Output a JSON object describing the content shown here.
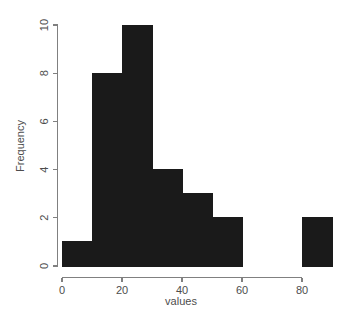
{
  "chart_data": {
    "type": "bar",
    "title": "",
    "xlabel": "values",
    "ylabel": "Frequency",
    "categories": [
      "0-10",
      "10-20",
      "20-30",
      "30-40",
      "40-50",
      "50-60",
      "60-70",
      "70-80",
      "80-90"
    ],
    "bin_edges": [
      0,
      10,
      20,
      30,
      40,
      50,
      60,
      70,
      80,
      90
    ],
    "bin_width": 10,
    "values": [
      1,
      8,
      10,
      4,
      3,
      2,
      0,
      0,
      2
    ],
    "x": [
      5,
      15,
      25,
      35,
      45,
      55,
      65,
      75,
      85
    ],
    "xlim": [
      0,
      90
    ],
    "ylim": [
      0,
      10
    ],
    "xticks": [
      0,
      20,
      40,
      60,
      80
    ],
    "xtick_labels": [
      "0",
      "20",
      "40",
      "60",
      "80"
    ],
    "yticks": [
      0,
      2,
      4,
      6,
      8,
      10
    ],
    "ytick_labels": [
      "0",
      "2",
      "4",
      "6",
      "8",
      "10"
    ],
    "grid": false,
    "legend": null,
    "bar_color": "#1a1a1a",
    "bar_edge_color": "#1a1a1a",
    "axis_color": "#808080",
    "text_color": "#4d4d4d",
    "background_color": "#ffffff",
    "total_count": 30
  }
}
